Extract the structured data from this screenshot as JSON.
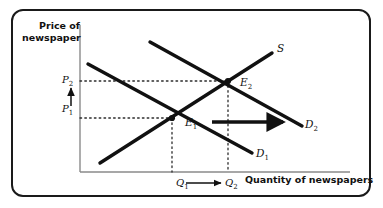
{
  "figure": {
    "type": "supply-demand-diagram",
    "axes": {
      "y_title": "Price of\nnewspaper",
      "x_title": "Quantity of newspapers",
      "origin_px": [
        80,
        172
      ],
      "y_axis_top_px": 25,
      "x_axis_right_px": 350,
      "axis_color": "#8a8a8a"
    },
    "curves": [
      {
        "name": "supply",
        "label": "S",
        "slope": "upward",
        "from_px": [
          100,
          163
        ],
        "to_px": [
          272,
          53
        ],
        "color": "#111111"
      },
      {
        "name": "demand-original",
        "label": "D",
        "label_sub": "1",
        "slope": "downward",
        "from_px": [
          88,
          64
        ],
        "to_px": [
          252,
          153
        ],
        "color": "#111111"
      },
      {
        "name": "demand-shifted",
        "label": "D",
        "label_sub": "2",
        "slope": "downward",
        "from_px": [
          150,
          42
        ],
        "to_px": [
          302,
          126
        ],
        "color": "#111111"
      }
    ],
    "equilibria": [
      {
        "name": "E",
        "label_sub": "1",
        "point_px": [
          172,
          118
        ],
        "price_label": "P",
        "price_sub": "1",
        "quantity_label": "Q",
        "quantity_sub": "1"
      },
      {
        "name": "E",
        "label_sub": "2",
        "point_px": [
          228,
          81
        ],
        "price_label": "P",
        "price_sub": "2",
        "quantity_label": "Q",
        "quantity_sub": "2"
      }
    ],
    "price_labels": [
      {
        "text": "P",
        "sub": "1",
        "y_px": 118
      },
      {
        "text": "P",
        "sub": "2",
        "y_px": 81
      }
    ],
    "quantity_labels": [
      {
        "text": "Q",
        "sub": "1",
        "x_px": 172
      },
      {
        "text": "Q",
        "sub": "2",
        "x_px": 228
      }
    ],
    "arrows": [
      {
        "name": "price-increase-arrow",
        "direction": "up",
        "from_px": [
          71,
          106
        ],
        "to_px": [
          71,
          88
        ]
      },
      {
        "name": "quantity-increase-arrow",
        "direction": "right",
        "from_px": [
          186,
          183
        ],
        "to_px": [
          221,
          183
        ]
      },
      {
        "name": "demand-shift-arrow",
        "direction": "right",
        "from_px": [
          212,
          122
        ],
        "to_px": [
          287,
          122
        ]
      }
    ],
    "guides": {
      "style": "dotted",
      "color": "#2b2b2b"
    },
    "colors": {
      "frame": "#1a1a1a",
      "background": "#ffffff",
      "ink": "#111111"
    }
  }
}
